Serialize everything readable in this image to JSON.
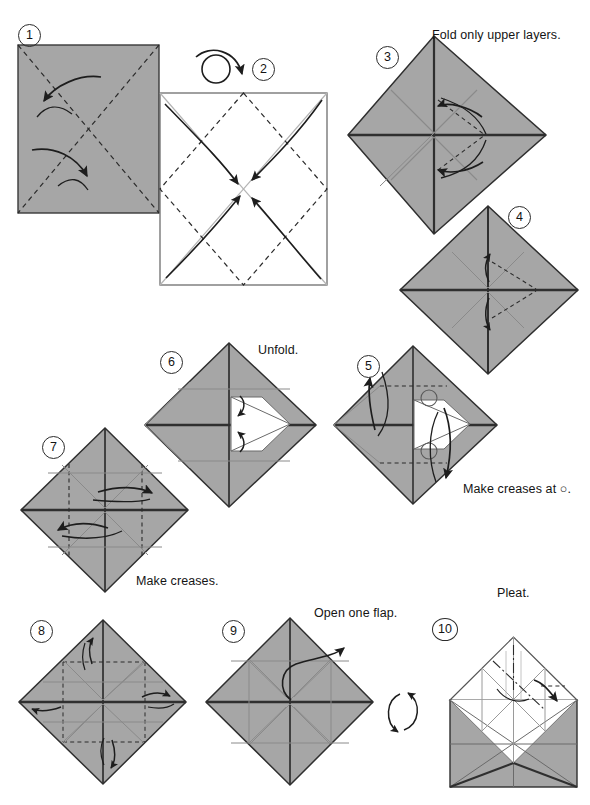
{
  "document": {
    "type": "origami-instruction-diagram",
    "title": "Origami folding sequence steps 1-10",
    "page_background": "#ffffff",
    "paper_front_color": "#a6a6a6",
    "paper_back_color": "#ffffff",
    "line_color": "#2b2b2b",
    "crease_color": "#7d7d7d"
  },
  "steps": [
    {
      "id": 1,
      "number": "1",
      "number_pos": {
        "x": 18,
        "y": 24
      },
      "caption": "",
      "shape": "square",
      "face": "front",
      "note": "Square seen flat, two diagonal valley creases, arrows folding corners"
    },
    {
      "id": 2,
      "number": "2",
      "number_pos": {
        "x": 252,
        "y": 68
      },
      "caption": "",
      "shape": "square",
      "face": "back",
      "note": "White side up, dashed diamond creases, four curved arrows bringing corners to center"
    },
    {
      "id": 3,
      "number": "3",
      "number_pos": {
        "x": 376,
        "y": 46
      },
      "caption": "Fold only upper layers.",
      "caption_pos": {
        "x": 432,
        "y": 30
      },
      "shape": "diamond",
      "face": "front"
    },
    {
      "id": 4,
      "number": "4",
      "number_pos": {
        "x": 508,
        "y": 208
      },
      "caption": "",
      "shape": "diamond",
      "face": "front"
    },
    {
      "id": 5,
      "number": "5",
      "number_pos": {
        "x": 357,
        "y": 355
      },
      "caption": "Make creases at ○.",
      "caption_pos": {
        "x": 463,
        "y": 483
      },
      "shape": "diamond",
      "face": "front"
    },
    {
      "id": 6,
      "number": "6",
      "number_pos": {
        "x": 160,
        "y": 351
      },
      "caption": "Unfold.",
      "caption_pos": {
        "x": 258,
        "y": 345
      },
      "shape": "diamond",
      "face": "front"
    },
    {
      "id": 7,
      "number": "7",
      "number_pos": {
        "x": 42,
        "y": 436
      },
      "caption": "Make creases.",
      "caption_pos": {
        "x": 136,
        "y": 576
      },
      "shape": "diamond",
      "face": "front"
    },
    {
      "id": 8,
      "number": "8",
      "number_pos": {
        "x": 30,
        "y": 620
      },
      "caption": "",
      "shape": "diamond",
      "face": "front"
    },
    {
      "id": 9,
      "number": "9",
      "number_pos": {
        "x": 222,
        "y": 620
      },
      "caption": "Open one flap.",
      "caption_pos": {
        "x": 315,
        "y": 608
      },
      "shape": "diamond",
      "face": "front"
    },
    {
      "id": 10,
      "number": "10",
      "number_pos": {
        "x": 434,
        "y": 618
      },
      "caption": "Pleat.",
      "caption_pos": {
        "x": 497,
        "y": 586
      },
      "shape": "square-with-flap",
      "face": "mixed"
    }
  ],
  "symbols": [
    {
      "name": "turn-over-symbol",
      "label": "turn over",
      "pos": {
        "x": 200,
        "y": 46
      }
    },
    {
      "name": "rotate-symbol",
      "label": "turn model around",
      "pos": {
        "x": 385,
        "y": 695
      }
    }
  ],
  "captions": {
    "fold_upper_layers": "Fold only upper layers.",
    "make_creases_at_circle": "Make creases at ○.",
    "unfold": "Unfold.",
    "make_creases": "Make creases.",
    "open_one_flap": "Open one flap.",
    "pleat": "Pleat."
  },
  "numbers": {
    "s1": "1",
    "s2": "2",
    "s3": "3",
    "s4": "4",
    "s5": "5",
    "s6": "6",
    "s7": "7",
    "s8": "8",
    "s9": "9",
    "s10": "10"
  }
}
